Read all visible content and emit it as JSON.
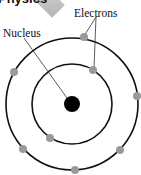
{
  "diagram": {
    "title_fragment": "Physics",
    "labels": {
      "nucleus": "Nucleus",
      "electrons": "Electrons"
    },
    "nucleus": {
      "cx": 72,
      "cy": 104,
      "r": 8,
      "color": "#000000"
    },
    "orbits": [
      {
        "name": "inner-orbit",
        "r": 40
      },
      {
        "name": "outer-orbit",
        "r": 66
      }
    ],
    "electrons": [
      {
        "orbit": "outer",
        "cx": 84,
        "cy": 37
      },
      {
        "orbit": "outer",
        "cx": 14,
        "cy": 72
      },
      {
        "orbit": "outer",
        "cx": 137,
        "cy": 96
      },
      {
        "orbit": "outer",
        "cx": 23,
        "cy": 149
      },
      {
        "orbit": "outer",
        "cx": 75,
        "cy": 170
      },
      {
        "orbit": "outer",
        "cx": 120,
        "cy": 150
      },
      {
        "orbit": "inner",
        "cx": 93,
        "cy": 70
      },
      {
        "orbit": "inner",
        "cx": 50,
        "cy": 138
      }
    ],
    "electron_color": "#999999",
    "line_color": "#111111"
  }
}
